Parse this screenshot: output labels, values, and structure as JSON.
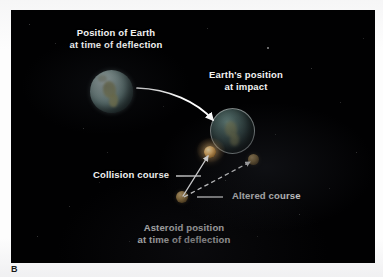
{
  "figure": {
    "panel_label": "B",
    "background_color": "#010102",
    "page_color": "#fdfdfd",
    "text_color": "#f2f2f2"
  },
  "labels": {
    "earth_deflection_line1": "Position of Earth",
    "earth_deflection_line2": "at time of deflection",
    "earth_impact_line1": "Earth's position",
    "earth_impact_line2": "at impact",
    "collision_course": "Collision course",
    "altered_course": "Altered course",
    "asteroid_line1": "Asteroid position",
    "asteroid_line2": "at time of deflection"
  },
  "objects": {
    "earth_deflection": {
      "name": "Earth at time of deflection",
      "color": "#9fb6b2"
    },
    "earth_impact": {
      "name": "Earth at impact",
      "color": "#425855"
    },
    "asteroid_impact": {
      "name": "Impacting asteroid",
      "color": "#e8b468"
    },
    "asteroid_deflection": {
      "name": "Asteroid at time of deflection",
      "color": "#9a7c45"
    },
    "asteroid_altered": {
      "name": "Deflected asteroid",
      "color": "#947741"
    }
  },
  "vectors": {
    "earth_motion": {
      "name": "Earth motion arrow",
      "style": "solid",
      "color": "#ffffff"
    },
    "collision_path": {
      "name": "Collision course path",
      "style": "solid",
      "color": "#ffffff"
    },
    "altered_path": {
      "name": "Altered course path",
      "style": "dashed",
      "color": "#ffffff"
    },
    "collision_leader": {
      "name": "Collision course leader line",
      "style": "solid",
      "color": "#ffffff"
    },
    "altered_leader": {
      "name": "Altered course leader line",
      "style": "solid",
      "color": "#ffffff"
    }
  }
}
